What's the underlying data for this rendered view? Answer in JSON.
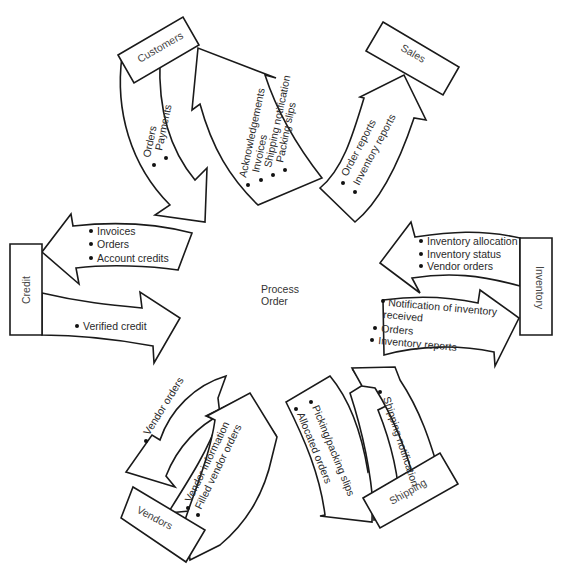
{
  "center": {
    "line1": "Process",
    "line2": "Order"
  },
  "entities": {
    "customers": "Customers",
    "sales": "Sales",
    "inventory": "Inventory",
    "shipping": "Shipping",
    "vendors": "Vendors",
    "credit": "Credit"
  },
  "flows": {
    "customers_in": [
      "Orders",
      "Payments"
    ],
    "customers_out": [
      "Acknowledgements",
      "Invoices",
      "Shipping notification",
      "Packing slips"
    ],
    "sales_out": [
      "Order reports",
      "Inventory reports"
    ],
    "inventory_in": [
      "Inventory allocation",
      "Inventory status",
      "Vendor orders"
    ],
    "inventory_out": [
      "Notification of inventory",
      "received",
      "Orders",
      "Inventory reports"
    ],
    "shipping_out": [
      "Picking/packing slips",
      "Allocated orders"
    ],
    "shipping_in": [
      "Shipping notification"
    ],
    "vendors_out": [
      "Vendor orders"
    ],
    "vendors_in": [
      "Vendor information",
      "Filled vendor orders"
    ],
    "credit_out": [
      "Invoices",
      "Orders",
      "Account credits"
    ],
    "credit_in": [
      "Verified credit"
    ]
  }
}
